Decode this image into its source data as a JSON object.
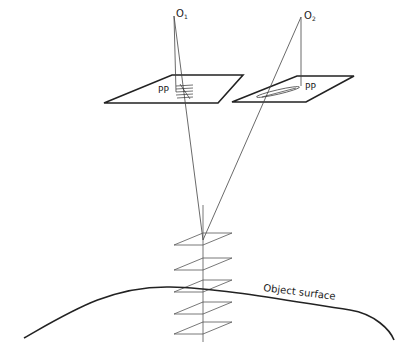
{
  "diagram": {
    "labels": {
      "o1": "O",
      "o1_sub": "1",
      "o2": "O",
      "o2_sub": "2",
      "pp_left": "PP",
      "pp_right": "PP",
      "surface": "Object surface"
    },
    "colors": {
      "line": "#222222",
      "thin_line": "#555555",
      "background": "#ffffff"
    }
  }
}
